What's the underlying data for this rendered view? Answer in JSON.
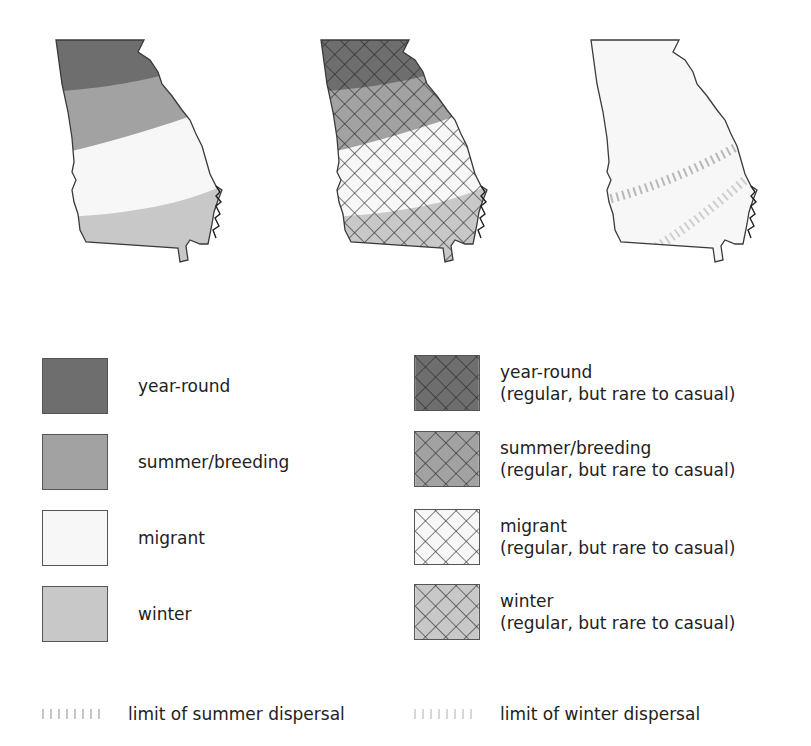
{
  "figure": {
    "type": "range-map-legend",
    "region": "Georgia"
  },
  "colors": {
    "year_round": "#6e6e6e",
    "summer_breeding": "#a2a2a2",
    "migrant": "#f7f7f7",
    "winter": "#c8c8c8",
    "outline": "#3a3a3a",
    "hatch": "#262626",
    "summer_limit": "#b8b8b8",
    "winter_limit": "#cfcfcf",
    "text": "#222222"
  },
  "maps": [
    {
      "id": "map-solid",
      "style": "solid-bands",
      "bands": [
        "year-round",
        "summer/breeding",
        "migrant",
        "winter"
      ]
    },
    {
      "id": "map-hatched",
      "style": "cross-hatched-bands",
      "bands": [
        "year-round",
        "summer/breeding",
        "migrant",
        "winter"
      ]
    },
    {
      "id": "map-dispersal",
      "style": "dispersal-limits",
      "lines": [
        "limit of summer dispersal",
        "limit of winter dispersal"
      ]
    }
  ],
  "legend": {
    "solid": [
      {
        "label": "year-round",
        "swatch": "solid",
        "color": "#6e6e6e"
      },
      {
        "label": "summer/breeding",
        "swatch": "solid",
        "color": "#a2a2a2"
      },
      {
        "label": "migrant",
        "swatch": "solid",
        "color": "#f7f7f7"
      },
      {
        "label": "winter",
        "swatch": "solid",
        "color": "#c8c8c8"
      }
    ],
    "hatched": [
      {
        "label": "year-round",
        "sublabel": "(regular, but rare to casual)",
        "swatch": "hatched",
        "color": "#6e6e6e"
      },
      {
        "label": "summer/breeding",
        "sublabel": "(regular, but rare to casual)",
        "swatch": "hatched",
        "color": "#a2a2a2"
      },
      {
        "label": "migrant",
        "sublabel": "(regular, but rare to casual)",
        "swatch": "hatched",
        "color": "#f7f7f7"
      },
      {
        "label": "winter",
        "sublabel": "(regular, but rare to casual)",
        "swatch": "hatched",
        "color": "#c8c8c8"
      }
    ],
    "dispersal": [
      {
        "label": "limit of summer dispersal",
        "symbol": "tick-line",
        "color": "#b8b8b8"
      },
      {
        "label": "limit of winter dispersal",
        "symbol": "tick-line",
        "color": "#cfcfcf"
      }
    ]
  }
}
